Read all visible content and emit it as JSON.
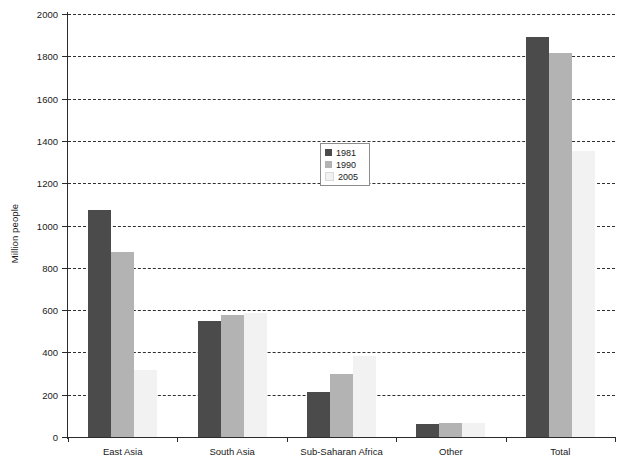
{
  "chart_data": {
    "type": "bar",
    "title": "",
    "xlabel": "",
    "ylabel": "Million people",
    "ylim": [
      0,
      2000
    ],
    "ytick_step": 200,
    "yticks": [
      0,
      200,
      400,
      600,
      800,
      1000,
      1200,
      1400,
      1600,
      1800,
      2000
    ],
    "ytick_labels": [
      "0",
      "200",
      "400",
      "600",
      "800",
      "1000",
      "1200",
      "1400",
      "1600",
      "1800",
      "2000"
    ],
    "grid": true,
    "grid_style": "dashed",
    "legend_position": "upper-center",
    "categories": [
      "East Asia",
      "South Asia",
      "Sub-Saharan Africa",
      "Other",
      "Total"
    ],
    "series": [
      {
        "name": "1981",
        "color": "#4b4b4b",
        "values": [
          1071,
          548,
          212,
          61,
          1892
        ]
      },
      {
        "name": "1990",
        "color": "#b3b3b3",
        "values": [
          873,
          579,
          296,
          66,
          1814
        ]
      },
      {
        "name": "2005",
        "color": "#f2f2f2",
        "values": [
          316,
          586,
          384,
          66,
          1352
        ]
      }
    ]
  },
  "colors": {
    "series_1981": "#4b4b4b",
    "series_1990": "#b3b3b3",
    "series_2005": "#f2f2f2",
    "axis": "#2b2b2b",
    "grid": "#2f2f2f",
    "text": "#1a1a1a",
    "background": "#ffffff",
    "legend_border": "#8c8c8c"
  }
}
